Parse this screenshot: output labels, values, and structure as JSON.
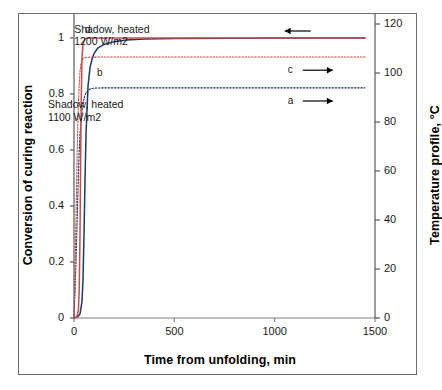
{
  "chart_data": {
    "type": "line",
    "title": "",
    "xlabel": "Time from unfolding, min",
    "ylabel": "Conversion of curing reaction",
    "ylabel_right": "Temperature profile, °C",
    "xlim": [
      0,
      1500
    ],
    "ylim": [
      0,
      1.05
    ],
    "ylim_right": [
      0,
      120
    ],
    "xticks": [
      "0",
      "500",
      "1000",
      "1500"
    ],
    "xtick_values": [
      0,
      500,
      1000,
      1500
    ],
    "yticks_left": [
      "0",
      "0.2",
      "0.4",
      "0.6",
      "0.8",
      "1"
    ],
    "ytick_values_left": [
      0,
      0.2,
      0.4,
      0.6,
      0.8,
      1
    ],
    "yticks_right": [
      "0",
      "20",
      "40",
      "60",
      "80",
      "100",
      "120"
    ],
    "ytick_values_right": [
      0,
      20,
      40,
      60,
      80,
      100,
      120
    ],
    "grid": false,
    "legend": "none",
    "annotations": [
      {
        "name": "annotation-1200",
        "text": "Shadow, heated\n1200 W/m2",
        "x": 300,
        "y": 1.04
      },
      {
        "name": "annotation-1100",
        "text": "Shadow, heated\n1100 W/m2",
        "x": 170,
        "y": 0.77
      }
    ],
    "series": [
      {
        "name": "a",
        "label": "a",
        "role": "temperature profile, 1100 W/m2",
        "axis": "right",
        "color": "#1F3864",
        "style": "dotted",
        "plateau_value_right_axis": 90,
        "plateau_value_left_scale": 0.82,
        "x": [
          0,
          5,
          10,
          15,
          20,
          25,
          30,
          40,
          50,
          60,
          80,
          100,
          150,
          300,
          600,
          1000,
          1450
        ],
        "y": [
          0.0,
          0.09,
          0.2,
          0.33,
          0.46,
          0.58,
          0.66,
          0.74,
          0.785,
          0.805,
          0.818,
          0.821,
          0.822,
          0.822,
          0.822,
          0.822,
          0.822
        ]
      },
      {
        "name": "b",
        "label": "b",
        "role": "conversion of curing reaction, 1100 W/m2",
        "axis": "left",
        "color": "#1F3864",
        "style": "solid",
        "plateau_value": 1.0,
        "x": [
          0,
          20,
          30,
          40,
          45,
          50,
          55,
          60,
          70,
          80,
          90,
          100,
          120,
          150,
          200,
          260,
          350,
          500,
          800,
          1200,
          1450
        ],
        "y": [
          0.0,
          0.005,
          0.015,
          0.06,
          0.14,
          0.3,
          0.5,
          0.66,
          0.83,
          0.895,
          0.925,
          0.945,
          0.965,
          0.977,
          0.987,
          0.993,
          0.996,
          0.998,
          0.999,
          1.0,
          1.0
        ]
      },
      {
        "name": "c",
        "label": "c",
        "role": "temperature profile, 1200 W/m2",
        "axis": "right",
        "color": "#C0504D",
        "style": "dotted",
        "plateau_value_right_axis": 102,
        "plateau_value_left_scale": 0.93,
        "x": [
          0,
          4,
          8,
          12,
          16,
          20,
          25,
          30,
          35,
          40,
          50,
          70,
          120,
          300,
          700,
          1100,
          1450
        ],
        "y": [
          0.0,
          0.12,
          0.27,
          0.44,
          0.6,
          0.72,
          0.82,
          0.88,
          0.91,
          0.923,
          0.929,
          0.931,
          0.932,
          0.932,
          0.932,
          0.932,
          0.932
        ]
      },
      {
        "name": "d",
        "label": "d",
        "role": "conversion of curing reaction, 1200 W/m2",
        "axis": "left",
        "color": "#C0504D",
        "style": "solid",
        "plateau_value": 1.0,
        "x": [
          0,
          15,
          22,
          26,
          30,
          33,
          36,
          40,
          45,
          55,
          80,
          200,
          600,
          1000,
          1450
        ],
        "y": [
          0.0,
          0.005,
          0.03,
          0.1,
          0.3,
          0.55,
          0.78,
          0.93,
          0.98,
          0.998,
          1.0,
          1.0,
          1.0,
          1.0,
          1.0
        ]
      }
    ],
    "curve_labels": [
      {
        "name": "curve-label-d",
        "text": "d",
        "x": 70,
        "y": 1.03
      },
      {
        "name": "curve-label-b",
        "text": "b",
        "x": 130,
        "y": 0.875
      },
      {
        "name": "curve-label-c",
        "text": "c",
        "x": 1080,
        "y": 0.885
      },
      {
        "name": "curve-label-a",
        "text": "a",
        "x": 1080,
        "y": 0.775
      }
    ],
    "arrows": [
      {
        "name": "arrow-left-to-d",
        "direction": "left",
        "x_from": 1180,
        "x_to": 1050,
        "y": 1.025
      },
      {
        "name": "arrow-right-to-c",
        "direction": "right",
        "x_from": 1140,
        "x_to": 1290,
        "y": 0.885
      },
      {
        "name": "arrow-right-to-a",
        "direction": "right",
        "x_from": 1140,
        "x_to": 1290,
        "y": 0.775
      }
    ]
  }
}
